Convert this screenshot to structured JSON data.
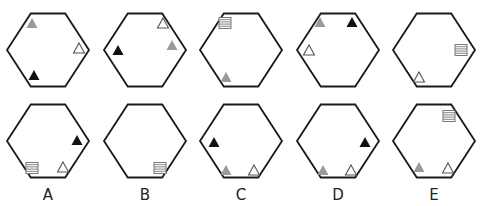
{
  "colors": {
    "outline": "#1a1a1a",
    "black": "#111111",
    "gray": "#9a9a9a",
    "hollow": "#555555",
    "stripe": "#777777"
  },
  "hexagon": {
    "width": 82,
    "height": 73
  },
  "rows": [
    {
      "name": "question-row",
      "cy": 50,
      "cells": [
        {
          "cx": 48,
          "shapes": [
            {
              "type": "triangle",
              "fill": "gray",
              "x": 32,
              "y": 23
            },
            {
              "type": "triangle",
              "fill": "hollow",
              "x": 79,
              "y": 48
            },
            {
              "type": "triangle",
              "fill": "black",
              "x": 34,
              "y": 75
            }
          ]
        },
        {
          "cx": 145,
          "shapes": [
            {
              "type": "triangle",
              "fill": "hollow",
              "x": 163,
              "y": 23
            },
            {
              "type": "triangle",
              "fill": "gray",
              "x": 172,
              "y": 45
            },
            {
              "type": "triangle",
              "fill": "black",
              "x": 118,
              "y": 50
            }
          ]
        },
        {
          "cx": 241,
          "shapes": [
            {
              "type": "stripes",
              "x": 225,
              "y": 23
            },
            {
              "type": "triangle",
              "fill": "gray",
              "x": 226,
              "y": 77
            }
          ]
        },
        {
          "cx": 338,
          "shapes": [
            {
              "type": "triangle",
              "fill": "gray",
              "x": 320,
              "y": 22
            },
            {
              "type": "triangle",
              "fill": "black",
              "x": 352,
              "y": 22
            },
            {
              "type": "triangle",
              "fill": "hollow",
              "x": 309,
              "y": 50
            }
          ]
        },
        {
          "cx": 434,
          "shapes": [
            {
              "type": "stripes",
              "x": 461,
              "y": 50
            },
            {
              "type": "triangle",
              "fill": "hollow",
              "x": 419,
              "y": 77
            }
          ]
        }
      ]
    },
    {
      "name": "answer-row",
      "cy": 141,
      "cells": [
        {
          "cx": 48,
          "label": "A",
          "shapes": [
            {
              "type": "triangle",
              "fill": "black",
              "x": 77,
              "y": 140
            },
            {
              "type": "stripes",
              "x": 32,
              "y": 168
            },
            {
              "type": "triangle",
              "fill": "hollow",
              "x": 63,
              "y": 167
            }
          ]
        },
        {
          "cx": 145,
          "label": "B",
          "shapes": [
            {
              "type": "stripes",
              "x": 160,
              "y": 168
            }
          ]
        },
        {
          "cx": 241,
          "label": "C",
          "shapes": [
            {
              "type": "triangle",
              "fill": "black",
              "x": 214,
              "y": 142
            },
            {
              "type": "triangle",
              "fill": "gray",
              "x": 226,
              "y": 170
            },
            {
              "type": "triangle",
              "fill": "hollow",
              "x": 254,
              "y": 170
            }
          ]
        },
        {
          "cx": 338,
          "label": "D",
          "shapes": [
            {
              "type": "triangle",
              "fill": "black",
              "x": 365,
              "y": 142
            },
            {
              "type": "triangle",
              "fill": "gray",
              "x": 323,
              "y": 170
            },
            {
              "type": "triangle",
              "fill": "hollow",
              "x": 351,
              "y": 170
            }
          ]
        },
        {
          "cx": 434,
          "label": "E",
          "shapes": [
            {
              "type": "stripes",
              "x": 449,
              "y": 116
            },
            {
              "type": "triangle",
              "fill": "gray",
              "x": 419,
              "y": 167
            },
            {
              "type": "triangle",
              "fill": "hollow",
              "x": 448,
              "y": 168
            }
          ]
        }
      ]
    }
  ],
  "labels": [
    "A",
    "B",
    "C",
    "D",
    "E"
  ]
}
